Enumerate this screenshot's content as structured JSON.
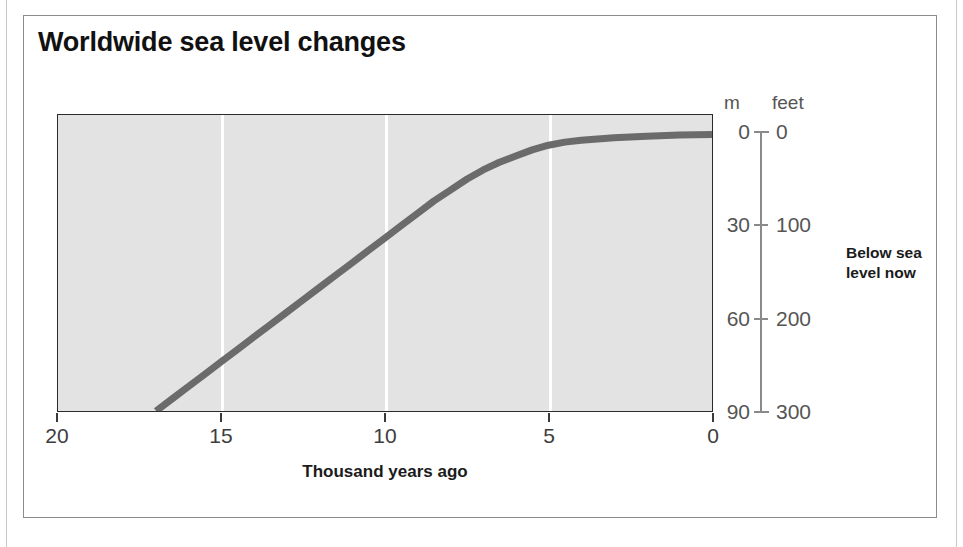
{
  "figure": {
    "title": "Worldwide sea level changes",
    "side_note_line1": "Below sea",
    "side_note_line2": "level now",
    "unit_header_left": "m",
    "unit_header_right": "feet"
  },
  "colors": {
    "curve": "#6b6b6b",
    "plot_background": "#e3e3e3",
    "gridline": "#ffffff",
    "axis": "#2b2b2b",
    "scale": "#8a8a8a",
    "title_text": "#111111",
    "tick_text": "#3d3d3d"
  },
  "chart_data": {
    "type": "line",
    "title": "Worldwide sea level changes",
    "subtitle": "",
    "xlabel": "Thousand years ago",
    "ylabel": "Below sea level now",
    "xlim": [
      20,
      0
    ],
    "ylim": [
      90,
      0
    ],
    "x_reversed": true,
    "y_reversed": true,
    "grid": true,
    "gridlines_x": [
      15,
      10,
      5
    ],
    "legend": "none",
    "x_ticks": [
      "20",
      "15",
      "10",
      "5",
      "0"
    ],
    "x_tick_values": [
      20,
      15,
      10,
      5,
      0
    ],
    "y_axis_primary": {
      "unit": "m",
      "ticks": [
        "0",
        "30",
        "60",
        "90"
      ],
      "tick_values": [
        0,
        30,
        60,
        90
      ]
    },
    "y_axis_secondary": {
      "unit": "feet",
      "ticks": [
        "0",
        "100",
        "200",
        "300"
      ],
      "tick_values": [
        0,
        100,
        200,
        300
      ]
    },
    "series": [
      {
        "name": "Sea level",
        "x": [
          17.0,
          16.5,
          16.0,
          15.5,
          15.0,
          14.5,
          14.0,
          13.5,
          13.0,
          12.5,
          12.0,
          11.5,
          11.0,
          10.5,
          10.0,
          9.5,
          9.0,
          8.5,
          8.0,
          7.5,
          7.0,
          6.5,
          6.0,
          5.5,
          5.0,
          4.5,
          4.0,
          3.0,
          2.0,
          1.0,
          0.0
        ],
        "y": [
          90,
          86,
          82,
          78,
          74,
          70,
          66,
          62,
          58,
          54,
          50,
          46,
          42,
          38,
          34,
          30,
          26,
          22,
          18.5,
          15,
          12,
          9.5,
          7.5,
          5.5,
          4,
          3,
          2.4,
          1.6,
          1.1,
          0.7,
          0.5
        ]
      }
    ]
  }
}
